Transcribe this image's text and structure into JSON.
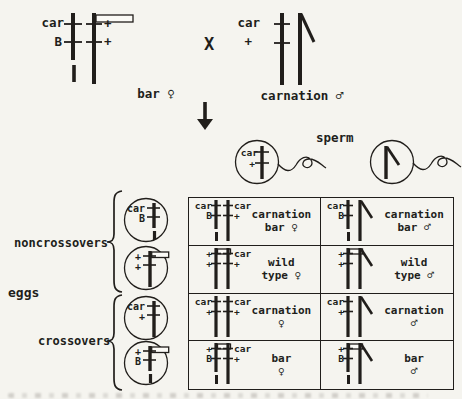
{
  "colors": {
    "ink": "#211e1b",
    "paper": "#f5f4ef",
    "rect_fill": "#fbfaf6"
  },
  "cross": {
    "symbol": "X",
    "female": {
      "name": "bar ♀",
      "chrom1_alleles": [
        "car",
        "B"
      ],
      "chrom2_alleles": [
        "+",
        "+"
      ]
    },
    "male": {
      "name": "carnation ♂",
      "x_alleles": [
        "car",
        "+"
      ]
    }
  },
  "sperm": {
    "label": "sperm",
    "x_cell_alleles": [
      "car",
      "+"
    ]
  },
  "eggs": {
    "label": "eggs",
    "groups": [
      {
        "label": "noncrossovers"
      },
      {
        "label": "crossovers"
      }
    ],
    "cells": [
      {
        "alleles": [
          "car",
          "B"
        ],
        "bar_rect": false,
        "bottom_dash": true,
        "group": "noncrossovers"
      },
      {
        "alleles": [
          "+",
          "+"
        ],
        "bar_rect": true,
        "bottom_dash": false,
        "group": "noncrossovers"
      },
      {
        "alleles": [
          "car",
          "+"
        ],
        "bar_rect": false,
        "bottom_dash": false,
        "group": "crossovers"
      },
      {
        "alleles": [
          "+",
          "B"
        ],
        "bar_rect": true,
        "bottom_dash": true,
        "group": "crossovers"
      }
    ]
  },
  "punnett": {
    "rows": [
      {
        "cells": [
          {
            "line1": "carnation",
            "line2": "bar ♀"
          },
          {
            "line1": "carnation",
            "line2": "bar ♂"
          }
        ]
      },
      {
        "cells": [
          {
            "line1": "wild",
            "line2": "type ♀"
          },
          {
            "line1": "wild",
            "line2": "type ♂"
          }
        ]
      },
      {
        "cells": [
          {
            "line1": "carnation",
            "line2": "♀"
          },
          {
            "line1": "carnation",
            "line2": "♂"
          }
        ]
      },
      {
        "cells": [
          {
            "line1": "bar",
            "line2": "♀"
          },
          {
            "line1": "bar",
            "line2": "♂"
          }
        ]
      }
    ]
  }
}
